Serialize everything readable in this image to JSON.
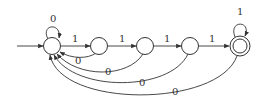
{
  "diagram": {
    "type": "finite-automaton",
    "states": [
      {
        "id": "q0",
        "initial": true,
        "accepting": false
      },
      {
        "id": "q1",
        "initial": false,
        "accepting": false
      },
      {
        "id": "q2",
        "initial": false,
        "accepting": false
      },
      {
        "id": "q3",
        "initial": false,
        "accepting": false
      },
      {
        "id": "q4",
        "initial": false,
        "accepting": true
      }
    ],
    "transitions": [
      {
        "from": "q0",
        "to": "q0",
        "label": "0"
      },
      {
        "from": "q0",
        "to": "q1",
        "label": "1"
      },
      {
        "from": "q1",
        "to": "q2",
        "label": "1"
      },
      {
        "from": "q2",
        "to": "q3",
        "label": "1"
      },
      {
        "from": "q3",
        "to": "q4",
        "label": "1"
      },
      {
        "from": "q4",
        "to": "q4",
        "label": "1"
      },
      {
        "from": "q1",
        "to": "q0",
        "label": "0"
      },
      {
        "from": "q2",
        "to": "q0",
        "label": "0"
      },
      {
        "from": "q3",
        "to": "q0",
        "label": "0"
      },
      {
        "from": "q4",
        "to": "q0",
        "label": "0"
      }
    ],
    "colors": {
      "stroke": "#333333",
      "background": "#ffffff"
    }
  }
}
